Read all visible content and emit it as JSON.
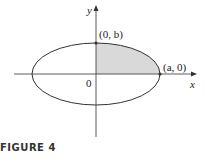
{
  "figure": {
    "caption": "FIGURE 4",
    "axes": {
      "x_label": "x",
      "y_label": "y",
      "origin_label": "0"
    },
    "points": [
      {
        "label": "(0, b)",
        "x": 0,
        "y": "b"
      },
      {
        "label": "(a, 0)",
        "x": "a",
        "y": 0
      }
    ],
    "shape": "ellipse",
    "shaded_region": "first quadrant of ellipse",
    "colors": {
      "shade": "#d9d9d9",
      "stroke": "#333333"
    }
  }
}
